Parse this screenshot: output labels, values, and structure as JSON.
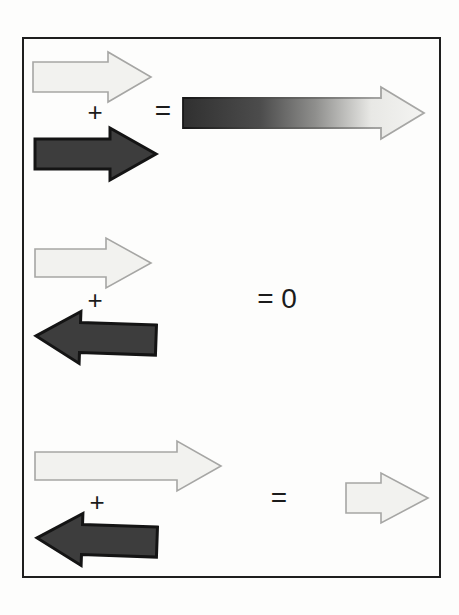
{
  "figure": {
    "kind": "vector-addition-diagram",
    "frame_border_color": "#1e1e1e",
    "colors": {
      "light_arrow_fill": "#f2f2ef",
      "light_arrow_stroke": "#a6a6a4",
      "dark_arrow_fill": "#3d3d3d",
      "dark_arrow_stroke": "#141414",
      "gradient_arrow_start": "#303030",
      "gradient_arrow_end": "#f4f4f2"
    },
    "rows": [
      {
        "operator": "+",
        "equals": "=",
        "operand1": "light arrow pointing right (medium)",
        "operand2": "dark arrow pointing right (medium)",
        "result": "long arrow pointing right with dark-to-light gradient"
      },
      {
        "operator": "+",
        "equals": "= 0",
        "operand1": "light arrow pointing right (medium)",
        "operand2": "dark arrow pointing left (medium)",
        "result": "zero"
      },
      {
        "operator": "+",
        "equals": "=",
        "operand1": "light arrow pointing right (long)",
        "operand2": "dark arrow pointing left (medium)",
        "result": "short light arrow pointing right"
      }
    ]
  }
}
